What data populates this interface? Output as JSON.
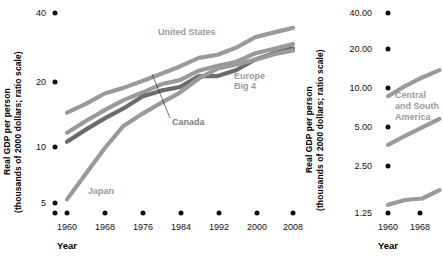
{
  "chart_data": [
    {
      "type": "line",
      "panel": "left",
      "title": "",
      "xlabel": "Year",
      "ylabel": "Real GDP per person (thousands of 2000 dollars; ratio scale)",
      "ylabel_lines": [
        "Real GDP per person",
        "(thousands of 2000 dollars; ratio scale)"
      ],
      "scale": "log",
      "grid": false,
      "legend_position": "inline-annotations",
      "xlim": [
        1960,
        2008
      ],
      "ylim": [
        4.4,
        45
      ],
      "yticks": [
        5,
        10,
        20,
        40
      ],
      "ytick_labels": [
        "5",
        "10",
        "20",
        "40"
      ],
      "xticks": [
        1960,
        1968,
        1976,
        1984,
        1992,
        2000,
        2008
      ],
      "xtick_labels": [
        "1960",
        "1968",
        "1976",
        "1984",
        "1992",
        "2000",
        "2008"
      ],
      "x": [
        1960,
        1964,
        1968,
        1972,
        1976,
        1980,
        1984,
        1988,
        1992,
        1996,
        2000,
        2004,
        2008
      ],
      "series": [
        {
          "name": "United States",
          "color": "#9a9a9a",
          "values": [
            13.3,
            14.8,
            16.8,
            18.0,
            19.6,
            21.4,
            23.4,
            26.0,
            27.0,
            29.5,
            33.5,
            35.5,
            37.5
          ]
        },
        {
          "name": "Europe Big 4",
          "color": "#9a9a9a",
          "values": [
            10.4,
            12.0,
            13.7,
            15.5,
            17.0,
            18.8,
            19.8,
            22.2,
            23.6,
            24.8,
            27.5,
            29.0,
            30.8
          ]
        },
        {
          "name": "Canada",
          "color": "#6b6b6b",
          "values": [
            9.3,
            10.8,
            12.4,
            14.0,
            16.2,
            17.4,
            18.2,
            20.8,
            20.8,
            22.4,
            25.5,
            27.5,
            29.2
          ]
        },
        {
          "name": "Japan",
          "color": "#9a9a9a",
          "values": [
            4.6,
            6.3,
            8.6,
            11.3,
            13.1,
            15.0,
            17.0,
            20.2,
            22.8,
            24.0,
            25.4,
            27.2,
            28.5
          ]
        }
      ],
      "annotations": [
        {
          "text": "United States",
          "series": "United States"
        },
        {
          "text": "Europe\nBig 4",
          "lines": [
            "Europe",
            "Big 4"
          ],
          "series": "Europe Big 4"
        },
        {
          "text": "Canada",
          "series": "Canada",
          "leader": true
        },
        {
          "text": "Japan",
          "series": "Japan"
        }
      ]
    },
    {
      "type": "line",
      "panel": "right",
      "title": "",
      "xlabel": "Year",
      "ylabel": "Real GDP per person (thousands of 2000 dollars; ratio scale)",
      "ylabel_lines": [
        "Real GDP per person",
        "(thousands of 2000 dollars; ratio scale)"
      ],
      "scale": "log",
      "grid": false,
      "clipped": true,
      "legend_position": "inline-annotations",
      "xlim": [
        1960,
        1974
      ],
      "ylim": [
        1.1,
        45
      ],
      "yticks": [
        1.25,
        2.5,
        5,
        10,
        20,
        40
      ],
      "ytick_labels": [
        "1.25",
        "2.50",
        "5.00",
        "10.00",
        "20.00",
        "40.00"
      ],
      "xticks": [
        1960,
        1968
      ],
      "xtick_labels": [
        "1960",
        "1968"
      ],
      "x": [
        1960,
        1964,
        1968,
        1972
      ],
      "series": [
        {
          "name": "upper-band",
          "color": "#9a9a9a",
          "values": [
            9.6,
            11.6,
            13.6,
            15.6
          ]
        },
        {
          "name": "Central and South America",
          "color": "#9a9a9a",
          "values": [
            3.9,
            4.6,
            5.4,
            6.3
          ]
        },
        {
          "name": "lower-band",
          "color": "#9a9a9a",
          "values": [
            1.28,
            1.4,
            1.44,
            1.68
          ]
        }
      ],
      "annotations": [
        {
          "text": "Central and South America",
          "lines": [
            "Central",
            "and South",
            "America"
          ],
          "series": "Central and South America"
        }
      ]
    }
  ],
  "left": {
    "ylabel_l1": "Real GDP per person",
    "ylabel_l2": "(thousands of 2000 dollars; ratio scale)",
    "xlabel": "Year",
    "yticks": [
      "40",
      "20",
      "10",
      "5"
    ],
    "xticks": [
      "1960",
      "1968",
      "1976",
      "1984",
      "1992",
      "2000",
      "2008"
    ],
    "label_us": "United States",
    "label_eu_l1": "Europe",
    "label_eu_l2": "Big 4",
    "label_canada": "Canada",
    "label_japan": "Japan"
  },
  "right": {
    "ylabel_l1": "Real GDP per person",
    "ylabel_l2": "(thousands of 2000 dollars; ratio scale)",
    "xlabel": "Year",
    "yticks": [
      "40.00",
      "20.00",
      "10.00",
      "5.00",
      "2.50",
      "1.25"
    ],
    "xticks": [
      "1960",
      "1968"
    ],
    "label_csa_l1": "Central",
    "label_csa_l2": "and South",
    "label_csa_l3": "America"
  },
  "colors": {
    "line_light": "#9a9a9a",
    "line_dark": "#6b6b6b",
    "text": "#111111",
    "label_text": "#9a9a9a",
    "background": "#ffffff"
  }
}
